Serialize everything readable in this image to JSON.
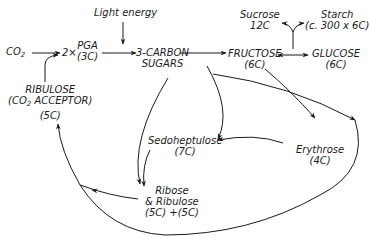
{
  "diagram": {
    "type": "metabolic-pathway",
    "nodes": {
      "co2": {
        "text": "CO",
        "sub": "2"
      },
      "pga": {
        "prefix": "2×",
        "line1": "PGA",
        "line2": "(3C)"
      },
      "light": {
        "text": "Light energy"
      },
      "three_carbon": {
        "line1": "3-CARBON",
        "line2": "SUGARS"
      },
      "fructose": {
        "line1": "FRUCTOSE",
        "line2": "(6C)"
      },
      "glucose": {
        "line1": "GLUCOSE",
        "line2": "(6C)"
      },
      "sucrose": {
        "line1": "Sucrose",
        "line2": "12C"
      },
      "starch": {
        "line1": "Starch",
        "line2": "(c. 300 x 6C)"
      },
      "ribulose": {
        "line1": "RIBULOSE",
        "line2_pre": "(CO",
        "line2_sub": "2",
        "line2_post": " ACCEPTOR)",
        "line3": "(5C)"
      },
      "sedoheptulose": {
        "line1": "Sedoheptulose",
        "line2": "(7C)"
      },
      "erythrose": {
        "line1": "Erythrose",
        "line2": "(4C)"
      },
      "ribose": {
        "line1": "Ribose",
        "line2": "& Ribulose",
        "line3": "(5C) +(5C)"
      }
    },
    "edges": [
      {
        "from": "CO2",
        "to": "2×PGA"
      },
      {
        "from": "RIBULOSE",
        "to": "2×PGA"
      },
      {
        "from": "2×PGA",
        "to": "3-CARBON SUGARS"
      },
      {
        "from": "Light energy",
        "to": "3-CARBON SUGARS"
      },
      {
        "from": "3-CARBON SUGARS",
        "to": "FRUCTOSE"
      },
      {
        "from": "FRUCTOSE",
        "to": "GLUCOSE",
        "bidirectional": true
      },
      {
        "from": "FRUCTOSE/GLUCOSE",
        "to": "Sucrose"
      },
      {
        "from": "FRUCTOSE/GLUCOSE",
        "to": "Starch"
      },
      {
        "from": "FRUCTOSE",
        "to": "Erythrose"
      },
      {
        "from": "3-CARBON SUGARS",
        "to": "Sedoheptulose"
      },
      {
        "from": "Erythrose",
        "to": "Sedoheptulose"
      },
      {
        "from": "3-CARBON SUGARS",
        "to": "Ribose & Ribulose"
      },
      {
        "from": "Sedoheptulose",
        "to": "Ribose & Ribulose"
      },
      {
        "from": "Ribose & Ribulose",
        "to": "RIBULOSE"
      },
      {
        "from": "3-CARBON SUGARS",
        "to": "RIBULOSE",
        "via": "large loop"
      }
    ]
  },
  "colors": {
    "ink": "#1a1a1a",
    "background": "#ffffff"
  }
}
